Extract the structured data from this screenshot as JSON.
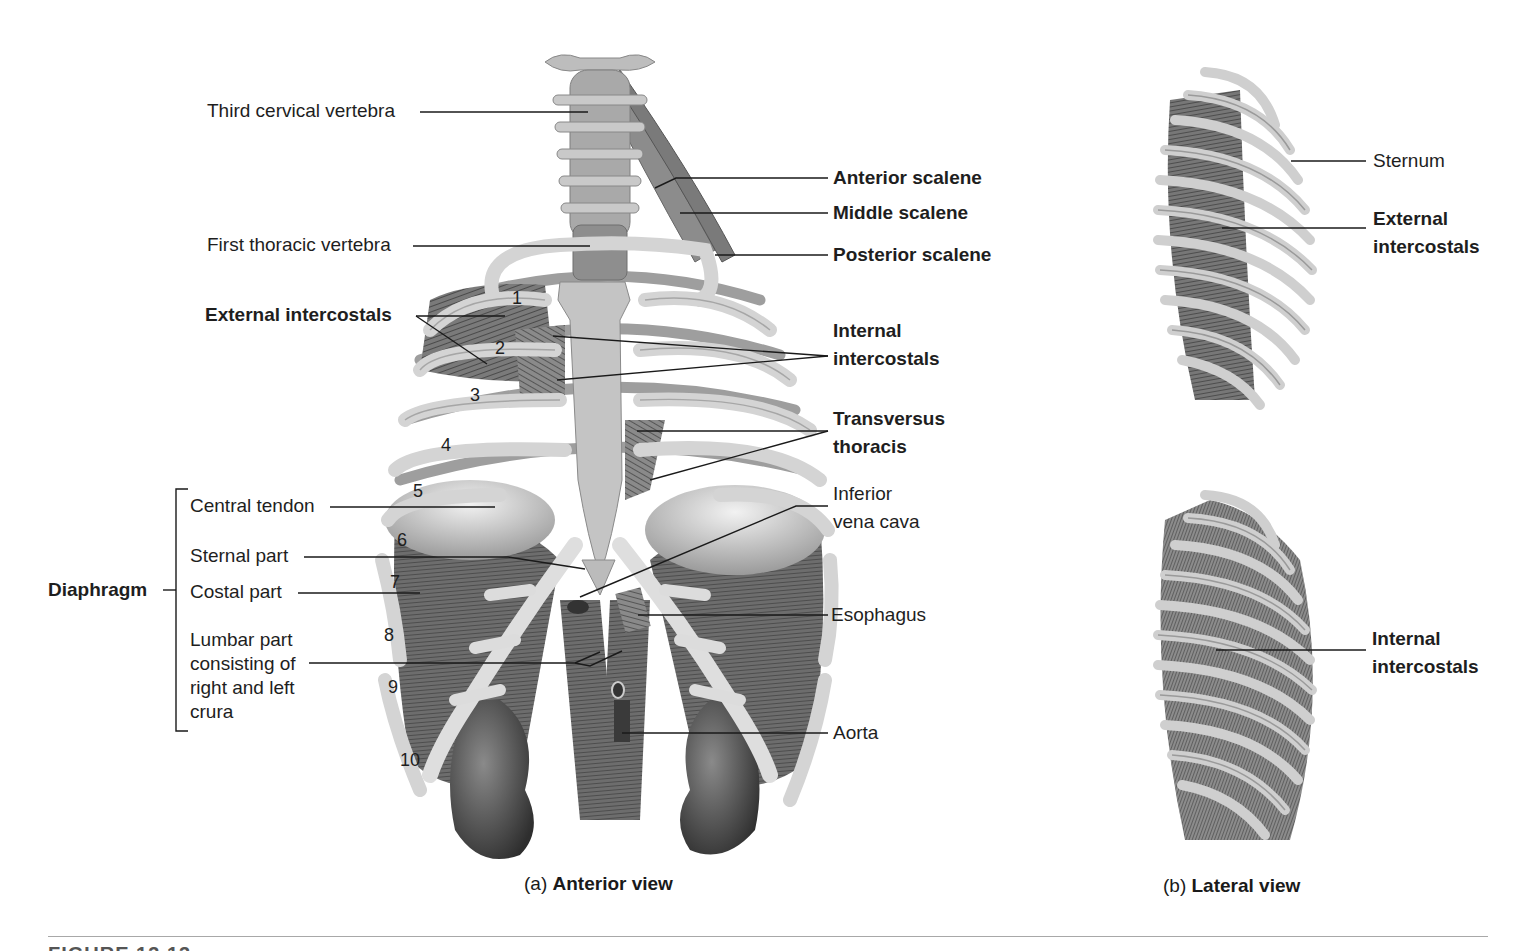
{
  "figure": {
    "panel_a": {
      "caption_prefix": "(a)",
      "caption_title": "Anterior view",
      "labels_left": {
        "third_cervical_vertebra": "Third cervical vertebra",
        "first_thoracic_vertebra": "First thoracic vertebra",
        "external_intercostals": "External intercostals"
      },
      "labels_right": {
        "anterior_scalene": "Anterior scalene",
        "middle_scalene": "Middle scalene",
        "posterior_scalene": "Posterior scalene",
        "internal_intercostals_line1": "Internal",
        "internal_intercostals_line2": "intercostals",
        "transversus_line1": "Transversus",
        "transversus_line2": "thoracis",
        "inferior_vena_cava_line1": "Inferior",
        "inferior_vena_cava_line2": "vena cava",
        "esophagus": "Esophagus",
        "aorta": "Aorta"
      },
      "diaphragm": {
        "group_label": "Diaphragm",
        "parts": {
          "central_tendon": "Central tendon",
          "sternal_part": "Sternal part",
          "costal_part": "Costal part",
          "lumbar_line1": "Lumbar part",
          "lumbar_line2": "consisting of",
          "lumbar_line3": "right and left",
          "lumbar_line4": "crura"
        }
      },
      "rib_numbers": [
        "1",
        "2",
        "3",
        "4",
        "5",
        "6",
        "7",
        "8",
        "9",
        "10"
      ]
    },
    "panel_b": {
      "caption_prefix": "(b)",
      "caption_title": "Lateral view",
      "top": {
        "sternum": "Sternum",
        "external_line1": "External",
        "external_line2": "intercostals"
      },
      "bottom": {
        "internal_line1": "Internal",
        "internal_line2": "intercostals"
      }
    },
    "figure_caption_partial": "FIGURE 13.13"
  }
}
